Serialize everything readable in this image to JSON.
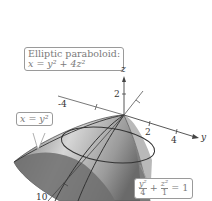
{
  "figure": {
    "callouts": {
      "surface": {
        "title": "Elliptic paraboloid:",
        "equation_lhs": "x",
        "equation_rhs": "y² + 4z²"
      },
      "trace_xy": {
        "lhs": "x",
        "rhs": "y²"
      },
      "trace_yz": {
        "term1_num": "y²",
        "term1_den": "4",
        "plus": "+",
        "term2_num": "z²",
        "term2_den": "1",
        "rhs": "= 1"
      }
    },
    "axes": {
      "z": {
        "label": "z",
        "ticks": [
          "2"
        ]
      },
      "y": {
        "label": "y",
        "ticks": [
          "-4",
          "2",
          "4"
        ]
      },
      "x": {
        "label": "x",
        "ticks": [
          "10"
        ]
      }
    },
    "colors": {
      "surface_dark": "#5a5a5a",
      "surface_light": "#d8d8d8",
      "axis": "#444444",
      "callout_border": "#9a9a9a"
    }
  }
}
